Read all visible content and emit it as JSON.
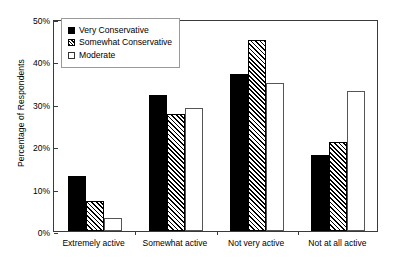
{
  "chart_data": {
    "type": "bar",
    "title": "",
    "xlabel": "",
    "ylabel": "Percentage of Respondents",
    "ylim": [
      0,
      50
    ],
    "ytick_labels": [
      "0%",
      "10%",
      "20%",
      "30%",
      "40%",
      "50%"
    ],
    "ytick_values": [
      0,
      10,
      20,
      30,
      40,
      50
    ],
    "grid": false,
    "legend_position": "top-left",
    "categories": [
      "Extremely active",
      "Somewhat active",
      "Not very active",
      "Not at all active"
    ],
    "series": [
      {
        "name": "Very Conservative",
        "fill": "solid-black",
        "color": "#000000",
        "values": [
          13,
          32,
          37,
          18
        ]
      },
      {
        "name": "Somewhat Conservative",
        "fill": "diagonal-hatch",
        "color": "#000000",
        "values": [
          7,
          27.5,
          45,
          21
        ]
      },
      {
        "name": "Moderate",
        "fill": "white",
        "color": "#ffffff",
        "values": [
          3,
          29,
          35,
          33
        ]
      }
    ]
  },
  "legend": {
    "items": [
      {
        "label": "Very Conservative"
      },
      {
        "label": "Somewhat Conservative"
      },
      {
        "label": "Moderate"
      }
    ]
  }
}
